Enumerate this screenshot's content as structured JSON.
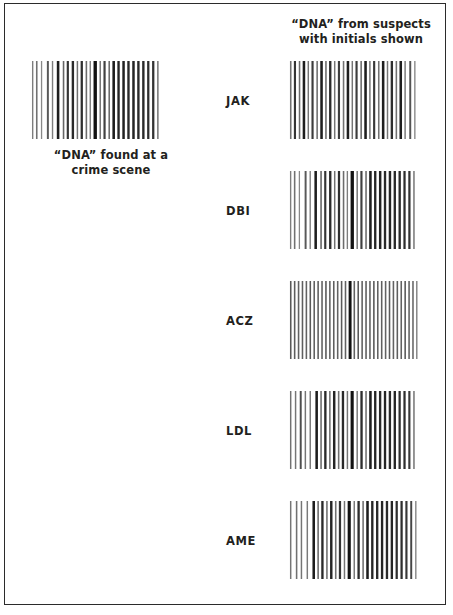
{
  "figure": {
    "type": "dna-fingerprint-comparison",
    "background_color": "#ffffff",
    "frame_color": "#2b2b2b",
    "bar_color": "#1a1a1a"
  },
  "header": {
    "caption": "“DNA” from suspects\nwith initials shown"
  },
  "crime_scene": {
    "caption": "“DNA” found at a\ncrime scene",
    "lane_name": "crime-scene-lane",
    "bands": [
      {
        "x": 2,
        "w": 1.4,
        "shade": 0.55
      },
      {
        "x": 6,
        "w": 1.6,
        "shade": 0.6
      },
      {
        "x": 11,
        "w": 1.3,
        "shade": 0.5
      },
      {
        "x": 17,
        "w": 2.0,
        "shade": 0.7
      },
      {
        "x": 22,
        "w": 1.4,
        "shade": 0.55
      },
      {
        "x": 27,
        "w": 2.6,
        "shade": 0.95
      },
      {
        "x": 33,
        "w": 1.6,
        "shade": 0.65
      },
      {
        "x": 37,
        "w": 2.2,
        "shade": 0.85
      },
      {
        "x": 42,
        "w": 2.4,
        "shade": 0.9
      },
      {
        "x": 47,
        "w": 1.5,
        "shade": 0.6
      },
      {
        "x": 51,
        "w": 2.3,
        "shade": 0.88
      },
      {
        "x": 56,
        "w": 1.6,
        "shade": 0.62
      },
      {
        "x": 60,
        "w": 1.4,
        "shade": 0.55
      },
      {
        "x": 64,
        "w": 3.4,
        "shade": 1.0
      },
      {
        "x": 70,
        "w": 1.5,
        "shade": 0.58
      },
      {
        "x": 74,
        "w": 2.2,
        "shade": 0.8
      },
      {
        "x": 79,
        "w": 1.6,
        "shade": 0.62
      },
      {
        "x": 83,
        "w": 2.6,
        "shade": 0.95
      },
      {
        "x": 88,
        "w": 2.4,
        "shade": 0.92
      },
      {
        "x": 93,
        "w": 2.5,
        "shade": 0.93
      },
      {
        "x": 98,
        "w": 2.4,
        "shade": 0.9
      },
      {
        "x": 103,
        "w": 2.5,
        "shade": 0.92
      },
      {
        "x": 108,
        "w": 2.4,
        "shade": 0.9
      },
      {
        "x": 113,
        "w": 2.4,
        "shade": 0.9
      },
      {
        "x": 118,
        "w": 2.3,
        "shade": 0.88
      },
      {
        "x": 123,
        "w": 2.3,
        "shade": 0.86
      },
      {
        "x": 128,
        "w": 1.6,
        "shade": 0.55
      }
    ]
  },
  "suspects": [
    {
      "initials": "JAK",
      "lane_name": "suspect-lane-jak",
      "matches_crime_scene": false,
      "bands": [
        {
          "x": 2,
          "w": 1.6,
          "shade": 0.6
        },
        {
          "x": 6,
          "w": 2.2,
          "shade": 0.85
        },
        {
          "x": 11,
          "w": 1.6,
          "shade": 0.62
        },
        {
          "x": 15,
          "w": 2.6,
          "shade": 0.95
        },
        {
          "x": 20,
          "w": 1.5,
          "shade": 0.58
        },
        {
          "x": 24,
          "w": 2.2,
          "shade": 0.82
        },
        {
          "x": 29,
          "w": 1.6,
          "shade": 0.6
        },
        {
          "x": 33,
          "w": 2.6,
          "shade": 0.95
        },
        {
          "x": 38,
          "w": 1.6,
          "shade": 0.62
        },
        {
          "x": 42,
          "w": 2.4,
          "shade": 0.9
        },
        {
          "x": 47,
          "w": 1.5,
          "shade": 0.58
        },
        {
          "x": 51,
          "w": 2.2,
          "shade": 0.82
        },
        {
          "x": 56,
          "w": 1.6,
          "shade": 0.6
        },
        {
          "x": 60,
          "w": 2.6,
          "shade": 0.95
        },
        {
          "x": 65,
          "w": 1.5,
          "shade": 0.58
        },
        {
          "x": 69,
          "w": 2.2,
          "shade": 0.82
        },
        {
          "x": 74,
          "w": 1.6,
          "shade": 0.62
        },
        {
          "x": 78,
          "w": 2.6,
          "shade": 0.95
        },
        {
          "x": 83,
          "w": 1.5,
          "shade": 0.58
        },
        {
          "x": 87,
          "w": 2.2,
          "shade": 0.84
        },
        {
          "x": 92,
          "w": 1.6,
          "shade": 0.6
        },
        {
          "x": 96,
          "w": 2.6,
          "shade": 0.95
        },
        {
          "x": 101,
          "w": 1.5,
          "shade": 0.58
        },
        {
          "x": 105,
          "w": 2.4,
          "shade": 0.88
        },
        {
          "x": 110,
          "w": 1.6,
          "shade": 0.6
        },
        {
          "x": 114,
          "w": 2.6,
          "shade": 0.95
        },
        {
          "x": 119,
          "w": 1.5,
          "shade": 0.56
        },
        {
          "x": 124,
          "w": 2.0,
          "shade": 0.72
        },
        {
          "x": 129,
          "w": 1.4,
          "shade": 0.5
        }
      ]
    },
    {
      "initials": "DBI",
      "lane_name": "suspect-lane-dbi",
      "matches_crime_scene": true,
      "bands": [
        {
          "x": 2,
          "w": 1.4,
          "shade": 0.55
        },
        {
          "x": 6,
          "w": 1.6,
          "shade": 0.6
        },
        {
          "x": 11,
          "w": 1.3,
          "shade": 0.5
        },
        {
          "x": 17,
          "w": 2.0,
          "shade": 0.7
        },
        {
          "x": 22,
          "w": 1.4,
          "shade": 0.55
        },
        {
          "x": 27,
          "w": 2.6,
          "shade": 0.95
        },
        {
          "x": 33,
          "w": 1.6,
          "shade": 0.65
        },
        {
          "x": 37,
          "w": 2.2,
          "shade": 0.85
        },
        {
          "x": 42,
          "w": 2.4,
          "shade": 0.9
        },
        {
          "x": 47,
          "w": 1.5,
          "shade": 0.6
        },
        {
          "x": 51,
          "w": 2.3,
          "shade": 0.88
        },
        {
          "x": 56,
          "w": 1.6,
          "shade": 0.62
        },
        {
          "x": 60,
          "w": 1.4,
          "shade": 0.55
        },
        {
          "x": 64,
          "w": 3.4,
          "shade": 1.0
        },
        {
          "x": 70,
          "w": 1.5,
          "shade": 0.58
        },
        {
          "x": 74,
          "w": 2.2,
          "shade": 0.8
        },
        {
          "x": 79,
          "w": 1.6,
          "shade": 0.62
        },
        {
          "x": 83,
          "w": 2.6,
          "shade": 0.95
        },
        {
          "x": 88,
          "w": 2.4,
          "shade": 0.92
        },
        {
          "x": 93,
          "w": 2.5,
          "shade": 0.93
        },
        {
          "x": 98,
          "w": 2.4,
          "shade": 0.9
        },
        {
          "x": 103,
          "w": 2.5,
          "shade": 0.92
        },
        {
          "x": 108,
          "w": 2.4,
          "shade": 0.9
        },
        {
          "x": 113,
          "w": 2.4,
          "shade": 0.9
        },
        {
          "x": 118,
          "w": 2.3,
          "shade": 0.88
        },
        {
          "x": 123,
          "w": 2.3,
          "shade": 0.86
        },
        {
          "x": 128,
          "w": 1.6,
          "shade": 0.55
        }
      ]
    },
    {
      "initials": "ACZ",
      "lane_name": "suspect-lane-acz",
      "matches_crime_scene": false,
      "bands": [
        {
          "x": 2,
          "w": 1.6,
          "shade": 0.7
        },
        {
          "x": 6,
          "w": 1.6,
          "shade": 0.68
        },
        {
          "x": 10,
          "w": 1.6,
          "shade": 0.66
        },
        {
          "x": 14,
          "w": 1.6,
          "shade": 0.68
        },
        {
          "x": 18,
          "w": 1.6,
          "shade": 0.66
        },
        {
          "x": 22,
          "w": 1.6,
          "shade": 0.7
        },
        {
          "x": 26,
          "w": 1.6,
          "shade": 0.66
        },
        {
          "x": 30,
          "w": 1.6,
          "shade": 0.68
        },
        {
          "x": 34,
          "w": 1.6,
          "shade": 0.66
        },
        {
          "x": 38,
          "w": 1.6,
          "shade": 0.7
        },
        {
          "x": 42,
          "w": 1.6,
          "shade": 0.66
        },
        {
          "x": 46,
          "w": 1.6,
          "shade": 0.68
        },
        {
          "x": 50,
          "w": 1.6,
          "shade": 0.66
        },
        {
          "x": 54,
          "w": 1.6,
          "shade": 0.7
        },
        {
          "x": 58,
          "w": 1.6,
          "shade": 0.66
        },
        {
          "x": 62,
          "w": 3.0,
          "shade": 1.0
        },
        {
          "x": 67,
          "w": 1.6,
          "shade": 0.66
        },
        {
          "x": 71,
          "w": 1.6,
          "shade": 0.7
        },
        {
          "x": 75,
          "w": 1.6,
          "shade": 0.66
        },
        {
          "x": 79,
          "w": 1.6,
          "shade": 0.68
        },
        {
          "x": 83,
          "w": 1.6,
          "shade": 0.66
        },
        {
          "x": 87,
          "w": 1.6,
          "shade": 0.7
        },
        {
          "x": 91,
          "w": 1.6,
          "shade": 0.66
        },
        {
          "x": 95,
          "w": 1.6,
          "shade": 0.68
        },
        {
          "x": 99,
          "w": 1.6,
          "shade": 0.66
        },
        {
          "x": 103,
          "w": 1.6,
          "shade": 0.7
        },
        {
          "x": 107,
          "w": 1.6,
          "shade": 0.66
        },
        {
          "x": 111,
          "w": 1.6,
          "shade": 0.68
        },
        {
          "x": 115,
          "w": 1.6,
          "shade": 0.66
        },
        {
          "x": 119,
          "w": 1.6,
          "shade": 0.7
        },
        {
          "x": 123,
          "w": 1.6,
          "shade": 0.66
        },
        {
          "x": 127,
          "w": 1.6,
          "shade": 0.64
        },
        {
          "x": 131,
          "w": 1.4,
          "shade": 0.55
        }
      ]
    },
    {
      "initials": "LDL",
      "lane_name": "suspect-lane-ldl",
      "matches_crime_scene": false,
      "bands": [
        {
          "x": 2,
          "w": 1.5,
          "shade": 0.6
        },
        {
          "x": 7,
          "w": 1.5,
          "shade": 0.58
        },
        {
          "x": 12,
          "w": 2.0,
          "shade": 0.75
        },
        {
          "x": 17,
          "w": 1.5,
          "shade": 0.58
        },
        {
          "x": 22,
          "w": 1.5,
          "shade": 0.56
        },
        {
          "x": 28,
          "w": 2.6,
          "shade": 0.95
        },
        {
          "x": 33,
          "w": 1.6,
          "shade": 0.62
        },
        {
          "x": 37,
          "w": 2.4,
          "shade": 0.9
        },
        {
          "x": 42,
          "w": 1.6,
          "shade": 0.6
        },
        {
          "x": 46,
          "w": 2.5,
          "shade": 0.92
        },
        {
          "x": 51,
          "w": 1.6,
          "shade": 0.6
        },
        {
          "x": 55,
          "w": 2.4,
          "shade": 0.9
        },
        {
          "x": 60,
          "w": 1.5,
          "shade": 0.58
        },
        {
          "x": 64,
          "w": 3.2,
          "shade": 1.0
        },
        {
          "x": 70,
          "w": 1.5,
          "shade": 0.56
        },
        {
          "x": 74,
          "w": 2.4,
          "shade": 0.88
        },
        {
          "x": 79,
          "w": 1.6,
          "shade": 0.6
        },
        {
          "x": 83,
          "w": 2.6,
          "shade": 0.95
        },
        {
          "x": 88,
          "w": 2.4,
          "shade": 0.92
        },
        {
          "x": 93,
          "w": 2.4,
          "shade": 0.9
        },
        {
          "x": 98,
          "w": 2.4,
          "shade": 0.92
        },
        {
          "x": 103,
          "w": 2.4,
          "shade": 0.9
        },
        {
          "x": 108,
          "w": 2.4,
          "shade": 0.92
        },
        {
          "x": 113,
          "w": 2.3,
          "shade": 0.88
        },
        {
          "x": 118,
          "w": 2.3,
          "shade": 0.88
        },
        {
          "x": 123,
          "w": 2.2,
          "shade": 0.84
        },
        {
          "x": 128,
          "w": 1.6,
          "shade": 0.56
        }
      ]
    },
    {
      "initials": "AME",
      "lane_name": "suspect-lane-ame",
      "matches_crime_scene": false,
      "bands": [
        {
          "x": 2,
          "w": 1.5,
          "shade": 0.58
        },
        {
          "x": 8,
          "w": 1.6,
          "shade": 0.6
        },
        {
          "x": 13,
          "w": 1.5,
          "shade": 0.58
        },
        {
          "x": 19,
          "w": 1.5,
          "shade": 0.56
        },
        {
          "x": 25,
          "w": 2.6,
          "shade": 0.95
        },
        {
          "x": 30,
          "w": 1.6,
          "shade": 0.62
        },
        {
          "x": 34,
          "w": 2.4,
          "shade": 0.9
        },
        {
          "x": 39,
          "w": 1.6,
          "shade": 0.6
        },
        {
          "x": 43,
          "w": 2.5,
          "shade": 0.92
        },
        {
          "x": 48,
          "w": 1.6,
          "shade": 0.6
        },
        {
          "x": 52,
          "w": 2.3,
          "shade": 0.86
        },
        {
          "x": 57,
          "w": 1.5,
          "shade": 0.58
        },
        {
          "x": 61,
          "w": 3.2,
          "shade": 1.0
        },
        {
          "x": 67,
          "w": 1.5,
          "shade": 0.56
        },
        {
          "x": 71,
          "w": 2.4,
          "shade": 0.88
        },
        {
          "x": 76,
          "w": 1.6,
          "shade": 0.6
        },
        {
          "x": 80,
          "w": 2.6,
          "shade": 0.95
        },
        {
          "x": 85,
          "w": 2.4,
          "shade": 0.92
        },
        {
          "x": 90,
          "w": 2.4,
          "shade": 0.9
        },
        {
          "x": 95,
          "w": 2.4,
          "shade": 0.92
        },
        {
          "x": 100,
          "w": 2.4,
          "shade": 0.9
        },
        {
          "x": 105,
          "w": 2.4,
          "shade": 0.92
        },
        {
          "x": 110,
          "w": 2.3,
          "shade": 0.88
        },
        {
          "x": 115,
          "w": 2.3,
          "shade": 0.88
        },
        {
          "x": 120,
          "w": 2.2,
          "shade": 0.84
        },
        {
          "x": 125,
          "w": 2.0,
          "shade": 0.78
        },
        {
          "x": 130,
          "w": 1.4,
          "shade": 0.52
        }
      ]
    }
  ]
}
